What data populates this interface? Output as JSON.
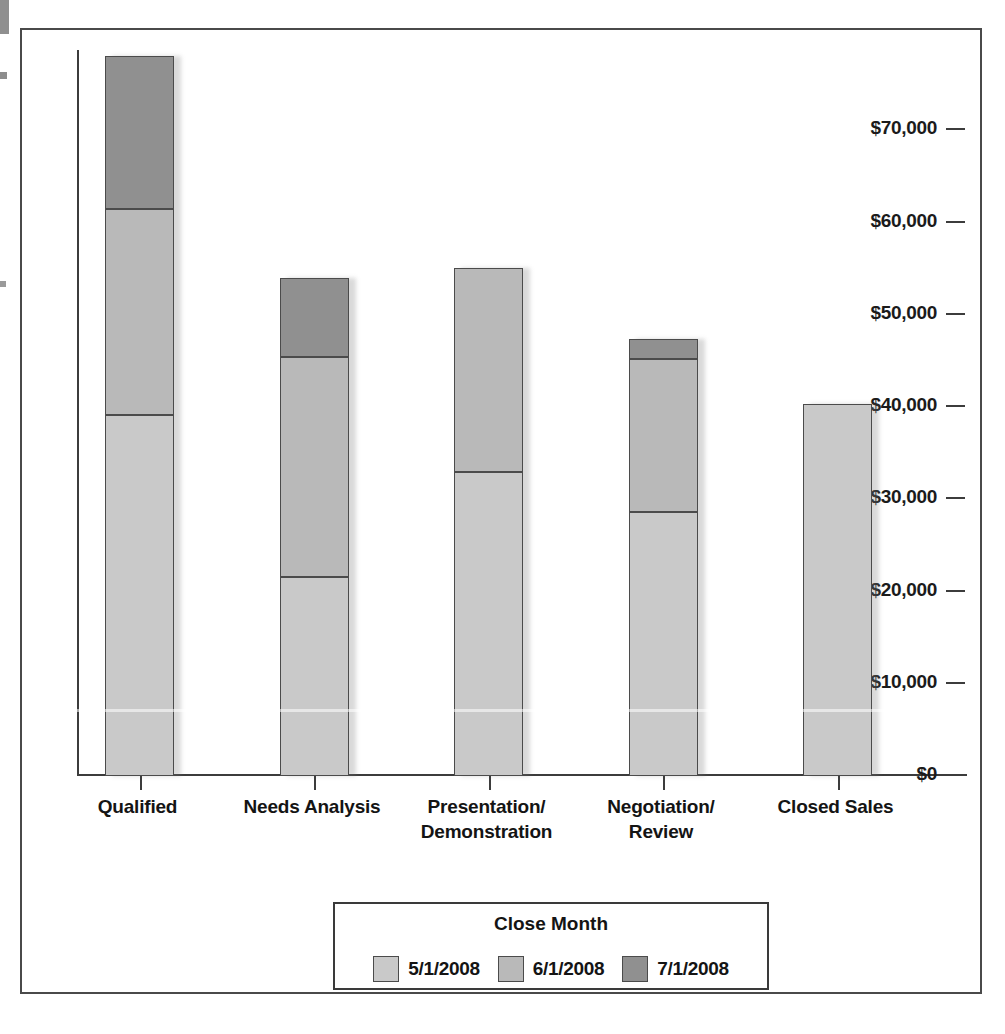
{
  "chart_data": {
    "type": "bar",
    "subtype": "stacked-column",
    "title": "",
    "xlabel": "",
    "ylabel": "",
    "categories": [
      "Qualified",
      "Needs Analysis",
      "Presentation/\nDemonstration",
      "Negotiation/\nReview",
      "Closed Sales"
    ],
    "series": [
      {
        "name": "5/1/2008",
        "color": "#c9c9c9",
        "values": [
          39150,
          21600,
          33000,
          28600,
          40350
        ]
      },
      {
        "name": "6/1/2008",
        "color": "#b9b9b9",
        "values": [
          22350,
          23800,
          22100,
          16600,
          0
        ]
      },
      {
        "name": "7/1/2008",
        "color": "#909090",
        "values": [
          16500,
          8600,
          0,
          2150,
          0
        ]
      }
    ],
    "totals": [
      78000,
      54000,
      55100,
      47350,
      40350
    ],
    "ylim": [
      0,
      78700
    ],
    "yticks": [
      0,
      10000,
      20000,
      30000,
      40000,
      50000,
      60000,
      70000
    ],
    "ytick_labels": [
      "$0",
      "$10,000",
      "$20,000",
      "$30,000",
      "$40,000",
      "$50,000",
      "$60,000",
      "$70,000"
    ],
    "grid": false,
    "legend_position": "bottom",
    "legend_title": "Close Month"
  },
  "y_axis": {
    "ticks": [
      {
        "label": "$70,000",
        "value": 70000
      },
      {
        "label": "$60,000",
        "value": 60000
      },
      {
        "label": "$50,000",
        "value": 50000
      },
      {
        "label": "$40,000",
        "value": 40000
      },
      {
        "label": "$30,000",
        "value": 30000
      },
      {
        "label": "$20,000",
        "value": 20000
      },
      {
        "label": "$10,000",
        "value": 10000
      },
      {
        "label": "$0",
        "value": 0
      }
    ]
  },
  "x_axis": {
    "categories": [
      {
        "line1": "Qualified",
        "line2": ""
      },
      {
        "line1": "Needs Analysis",
        "line2": ""
      },
      {
        "line1": "Presentation/",
        "line2": "Demonstration"
      },
      {
        "line1": "Negotiation/",
        "line2": "Review"
      },
      {
        "line1": "Closed Sales",
        "line2": ""
      }
    ]
  },
  "legend": {
    "title": "Close Month",
    "items": [
      {
        "label": "5/1/2008",
        "color": "#c9c9c9"
      },
      {
        "label": "6/1/2008",
        "color": "#b9b9b9"
      },
      {
        "label": "7/1/2008",
        "color": "#909090"
      }
    ]
  }
}
